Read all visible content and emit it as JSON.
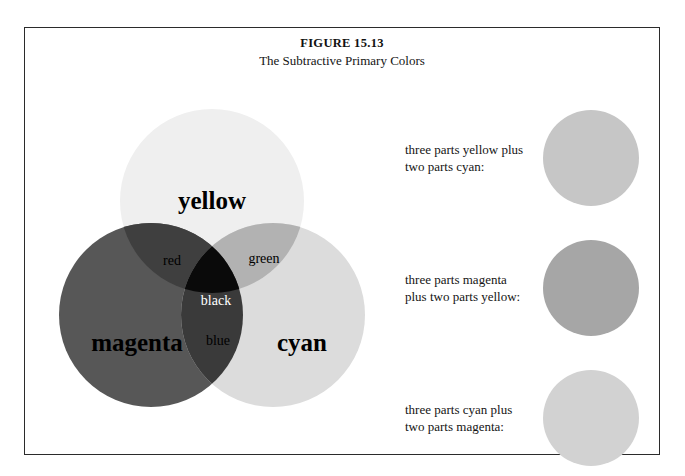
{
  "figure": {
    "number": "FIGURE 15.13",
    "subtitle": "The Subtractive Primary Colors"
  },
  "venn": {
    "primaries": [
      {
        "name": "yellow",
        "label": "yellow",
        "color": "#efefef",
        "cx": 185,
        "cy": 118,
        "r": 92
      },
      {
        "name": "magenta",
        "label": "magenta",
        "color": "#575757",
        "cx": 124,
        "cy": 232,
        "r": 92
      },
      {
        "name": "cyan",
        "label": "cyan",
        "color": "#dcdcdc",
        "cx": 246,
        "cy": 232,
        "r": 92
      }
    ],
    "overlaps": [
      {
        "name": "red",
        "label": "red",
        "color": "#3f3f3f",
        "text_color": "dark"
      },
      {
        "name": "green",
        "label": "green",
        "color": "#b2b2b2",
        "text_color": "dark"
      },
      {
        "name": "blue",
        "label": "blue",
        "color": "#3a3a3a",
        "text_color": "dark"
      },
      {
        "name": "black",
        "label": "black",
        "color": "#0a0a0a",
        "text_color": "light"
      }
    ]
  },
  "mixtures": [
    {
      "name": "yellow-plus-cyan",
      "caption": "three parts yellow plus two parts cyan:",
      "swatch_color": "#c6c6c6"
    },
    {
      "name": "magenta-plus-yellow",
      "caption": "three parts magenta plus two parts yellow:",
      "swatch_color": "#a6a6a6"
    },
    {
      "name": "cyan-plus-magenta",
      "caption": "three parts cyan plus two parts magenta:",
      "swatch_color": "#d2d2d2"
    }
  ]
}
